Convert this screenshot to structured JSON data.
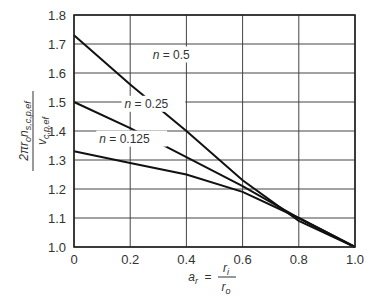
{
  "chart_data": {
    "type": "line",
    "title": "",
    "xlabel": "a_r = r_i / r_o",
    "ylabel": "2π r_o n_{s,c,p,ef} / v_{c,p,ef}",
    "xlim": [
      0,
      1.0
    ],
    "ylim": [
      1.0,
      1.8
    ],
    "xticks": [
      "0",
      "0.2",
      "0.4",
      "0.6",
      "0.8",
      "1.0"
    ],
    "yticks": [
      "1.0",
      "1.1",
      "1.2",
      "1.3",
      "1.4",
      "1.5",
      "1.6",
      "1.7",
      "1.8"
    ],
    "grid": true,
    "x": [
      0,
      0.2,
      0.4,
      0.6,
      0.8,
      1.0
    ],
    "series": [
      {
        "name": "n = 0.5",
        "values": [
          1.73,
          1.56,
          1.4,
          1.23,
          1.09,
          1.0
        ]
      },
      {
        "name": "n = 0.25",
        "values": [
          1.5,
          1.41,
          1.31,
          1.21,
          1.1,
          1.0
        ]
      },
      {
        "name": "n = 0.125",
        "values": [
          1.33,
          1.29,
          1.25,
          1.19,
          1.1,
          1.0
        ]
      }
    ],
    "annotations": [
      {
        "text": "n = 0.5",
        "x": 0.28,
        "y": 1.65
      },
      {
        "text": "n = 0.25",
        "x": 0.18,
        "y": 1.48
      },
      {
        "text": "n = 0.125",
        "x": 0.09,
        "y": 1.36
      }
    ]
  },
  "labels": {
    "x_axis_var": "a",
    "x_axis_sub": "r",
    "x_axis_eq": "=",
    "x_axis_num": "r",
    "x_axis_num_sub": "i",
    "x_axis_den": "r",
    "x_axis_den_sub": "o",
    "y_axis_num": "2πr",
    "y_axis_num_sub1": "o",
    "y_axis_num_mid": "n",
    "y_axis_num_sub2": "s,c,p,ef",
    "y_axis_den": "v",
    "y_axis_den_sub": "c,p,ef"
  }
}
